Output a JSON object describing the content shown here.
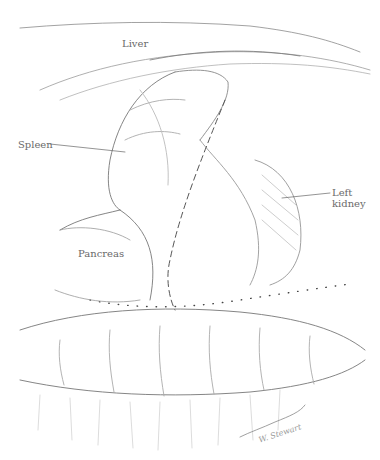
{
  "illustration": {
    "type": "anatomical line drawing",
    "labels": [
      {
        "id": "liver",
        "text": "Liver"
      },
      {
        "id": "spleen",
        "text": "Spleen"
      },
      {
        "id": "left-kidney",
        "text": "Left\nkidney",
        "line1": "Left",
        "line2": "kidney"
      },
      {
        "id": "pancreas",
        "text": "Pancreas"
      }
    ],
    "signature": "W. Stewart",
    "colors": {
      "ink": "#555555",
      "light_ink": "#9a9a9a",
      "dots": "#444444",
      "background": "#ffffff"
    }
  }
}
